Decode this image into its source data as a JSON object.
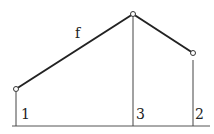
{
  "diagram": {
    "function_label": "f",
    "points": [
      {
        "id": "1",
        "label": "1",
        "x": 16,
        "y": 89
      },
      {
        "id": "3",
        "label": "3",
        "x": 133,
        "y": 14
      },
      {
        "id": "2",
        "label": "2",
        "x": 193,
        "y": 53
      }
    ],
    "baseline_y": 126,
    "colors": {
      "stroke": "#222222",
      "thin_line": "#444444",
      "background": "#ffffff"
    }
  }
}
